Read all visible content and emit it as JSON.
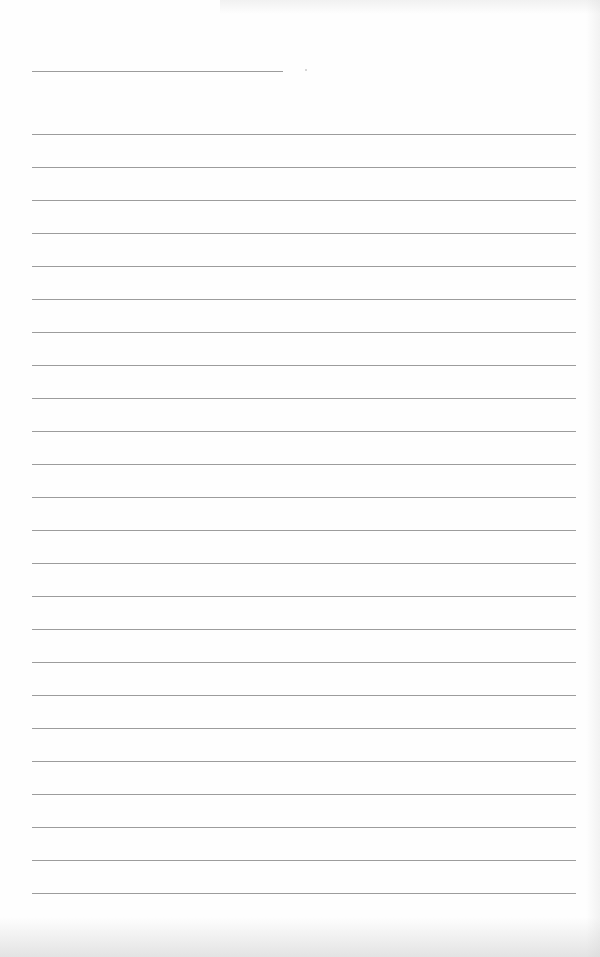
{
  "page": {
    "type": "blank lined notebook page",
    "background_color": "#ffffff",
    "line_color": "#9c9c9c"
  },
  "header_line": {
    "left": 32,
    "top": 71,
    "width": 251
  },
  "speck": {
    "left": 305,
    "top": 69
  },
  "ruled_lines": {
    "count": 24,
    "left": 32,
    "width": 544,
    "first_top": 134,
    "spacing": 33
  }
}
